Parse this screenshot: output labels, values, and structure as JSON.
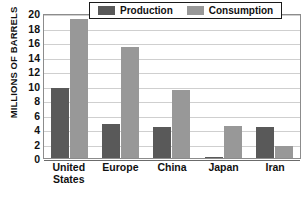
{
  "chart_data": {
    "type": "bar",
    "title": "",
    "xlabel": "",
    "ylabel": "MILLIONS OF BARRELS",
    "ylim": [
      0,
      20
    ],
    "yticks": [
      20,
      18,
      16,
      14,
      12,
      10,
      8,
      6,
      4,
      2,
      0
    ],
    "grid": true,
    "legend_position": "top",
    "categories": [
      "United States",
      "Europe",
      "China",
      "Japan",
      "Iran"
    ],
    "category_lines": [
      [
        "United",
        "States"
      ],
      [
        "Europe"
      ],
      [
        "China"
      ],
      [
        "Japan"
      ],
      [
        "Iran"
      ]
    ],
    "series": [
      {
        "name": "Production",
        "color": "#595959",
        "values": [
          9.7,
          4.7,
          4.3,
          0.2,
          4.3
        ]
      },
      {
        "name": "Consumption",
        "color": "#989898",
        "values": [
          19.2,
          15.3,
          9.4,
          4.4,
          1.7
        ]
      }
    ]
  }
}
